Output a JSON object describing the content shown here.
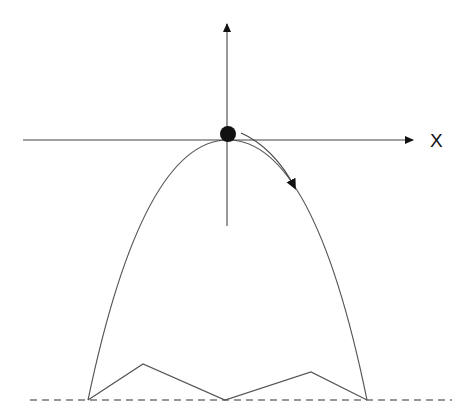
{
  "diagram": {
    "x_axis_label": "X",
    "colors": {
      "line": "#555555",
      "axis": "#444444",
      "ball": "#111111",
      "dashed": "#777777",
      "background": "#ffffff"
    },
    "elements": {
      "vertical_axis": {
        "x": 227,
        "y_top": 22,
        "y_bottom": 226
      },
      "horizontal_axis": {
        "y": 140,
        "x_left": 23,
        "x_right": 415
      },
      "ball": {
        "cx": 228,
        "cy": 134,
        "r": 8
      },
      "parabola": {
        "apex": [
          228,
          140
        ],
        "left_end": [
          88,
          400
        ],
        "right_end": [
          367,
          400
        ]
      },
      "zigzag_points": [
        [
          88,
          400
        ],
        [
          143,
          364
        ],
        [
          225,
          400
        ],
        [
          311,
          372
        ],
        [
          367,
          400
        ]
      ],
      "ground_dashed_line": {
        "y": 400,
        "x_start": 30,
        "x_end": 452
      },
      "motion_arrow": {
        "start": [
          241,
          133
        ],
        "end": [
          296,
          190
        ]
      }
    }
  }
}
